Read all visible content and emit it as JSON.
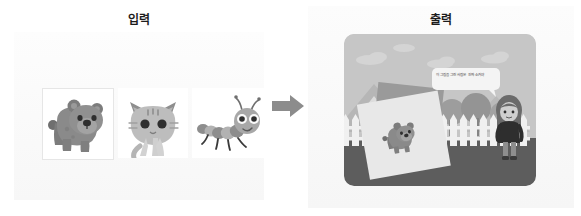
{
  "panels": {
    "input": {
      "title": "입력",
      "items": [
        {
          "name": "bear",
          "label": "곰",
          "icon": "bear-illustration"
        },
        {
          "name": "cat",
          "label": "고양이",
          "icon": "cat-illustration"
        },
        {
          "name": "caterpillar",
          "label": "애벌레",
          "icon": "caterpillar-illustration"
        }
      ]
    },
    "output": {
      "title": "출력",
      "scene": {
        "speech_bubble": "이 그림을 그린 사람은 진짜 소커야",
        "character": "girl-standing",
        "picture_card": "bear-drawing-card",
        "background_elements": [
          "sky",
          "clouds",
          "mountains",
          "trees",
          "picket-fence",
          "ground"
        ]
      }
    }
  },
  "arrow": {
    "direction": "right",
    "name": "transform-arrow"
  },
  "colors": {
    "page_background": "#ffffff",
    "panel_background": "#f8f8f8",
    "title_text": "#1c1c1c",
    "arrow": "#8c8c8c",
    "scene_sky": "#c9c9c9",
    "scene_ground": "#5d5d5d",
    "fence": "#f2f2f2",
    "card_front": "#e8e8e8",
    "card_back": "#9a9a9a",
    "bear_body": "#8a8a8a",
    "bubble_fill": "#f4f4f4",
    "bubble_text": "#4a4a4a"
  }
}
